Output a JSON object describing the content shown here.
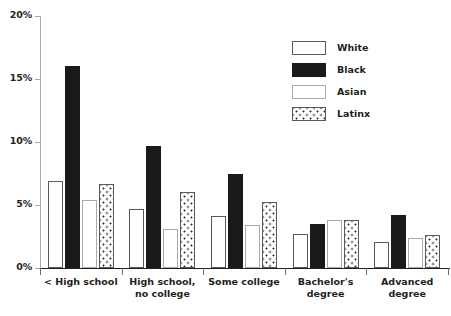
{
  "chart_data": {
    "type": "bar",
    "title": "",
    "subtitle": "",
    "xlabel": "",
    "ylabel": "",
    "ylim": [
      0,
      20
    ],
    "ytick_labels": [
      "0%",
      "5%",
      "10%",
      "15%",
      "20%"
    ],
    "ytick_values": [
      0,
      5,
      10,
      15,
      20
    ],
    "grid": false,
    "legend_position": "top-right",
    "categories": [
      "< High school",
      "High school,\nno college",
      "Some college",
      "Bachelor's degree",
      "Advanced degree"
    ],
    "series": [
      {
        "name": "White",
        "values": [
          6.9,
          4.7,
          4.1,
          2.7,
          2.1
        ]
      },
      {
        "name": "Black",
        "values": [
          16.0,
          9.7,
          7.5,
          3.5,
          4.2
        ]
      },
      {
        "name": "Asian",
        "values": [
          5.4,
          3.1,
          3.4,
          3.8,
          2.4
        ]
      },
      {
        "name": "Latinx",
        "values": [
          6.7,
          6.0,
          5.2,
          3.8,
          2.6
        ]
      }
    ],
    "series_styles": [
      "white",
      "black",
      "asian",
      "latinx"
    ],
    "colors": {
      "white_fill": "#ffffff",
      "white_border": "#58595b",
      "black_fill": "#1a1a1a",
      "asian_fill": "#ffffff",
      "asian_border": "#a7a9ac",
      "latinx_pattern": "#2b2b2b",
      "axis": "#231f20",
      "text": "#231f20"
    },
    "value_suffix": "%"
  },
  "legend": {
    "items": [
      {
        "label": "White"
      },
      {
        "label": "Black"
      },
      {
        "label": "Asian"
      },
      {
        "label": "Latinx"
      }
    ]
  }
}
